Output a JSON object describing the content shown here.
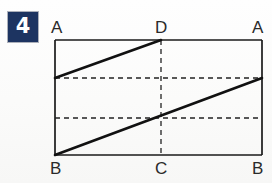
{
  "problem": {
    "number": "4",
    "badge_color": "#1d3461",
    "badge_text_color": "#ffffff"
  },
  "figure": {
    "background_color": "#fdfdfc",
    "stroke_color": "#1a1a1a",
    "labels": {
      "top_left": "A",
      "top_middle": "D",
      "top_right": "A",
      "bottom_left": "B",
      "bottom_middle": "C",
      "bottom_right": "B"
    },
    "geometry": {
      "rect": {
        "left": 55,
        "top": 40,
        "right": 262,
        "bottom": 155
      },
      "vertical_dashed_x": 161,
      "horizontal_dashed_y": [
        78,
        118
      ],
      "diagonal_upper": {
        "x1": 55,
        "y1": 78,
        "x2": 161,
        "y2": 40
      },
      "diagonal_lower": {
        "x1": 55,
        "y1": 155,
        "x2": 262,
        "y2": 78
      },
      "solid_stroke_width": 2.6,
      "outline_stroke_width": 1.7,
      "dash_stroke_width": 1.3,
      "dash_pattern": "5,4"
    }
  }
}
